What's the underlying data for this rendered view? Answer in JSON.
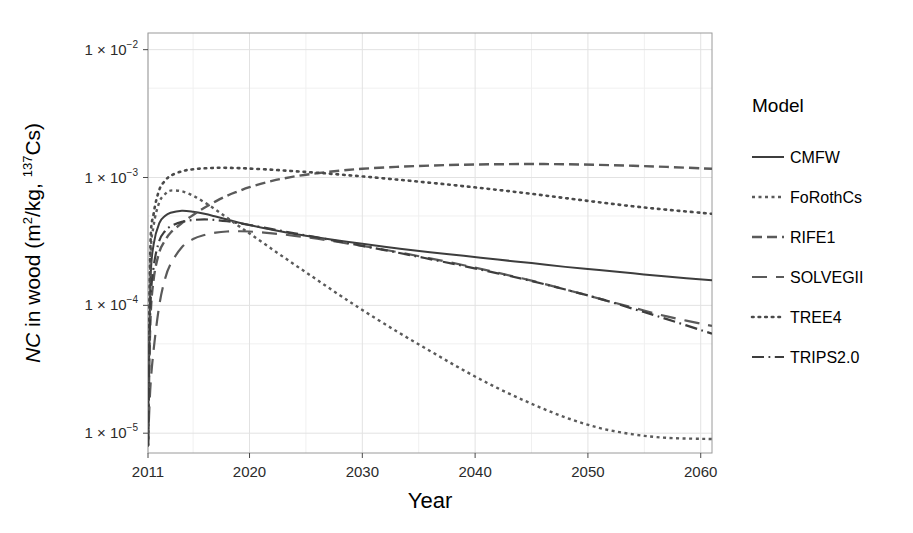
{
  "chart_data": {
    "type": "line",
    "title": "",
    "xlabel": "Year",
    "ylabel_parts": {
      "italic": "NC",
      "rest": " in wood (m",
      "sup1": "2",
      "mid": "/kg, ",
      "sup2": "137",
      "tail": "Cs)"
    },
    "ylabel_plain": "NC in wood (m2/kg, 137Cs)",
    "xlim": [
      2011,
      2061
    ],
    "ylim": [
      7e-06,
      0.0135
    ],
    "yscale": "log",
    "grid": true,
    "legend_position": "right",
    "legend_title": "Model",
    "xticks": [
      2011,
      2020,
      2030,
      2040,
      2050,
      2060
    ],
    "xtick_labels": [
      "2011",
      "2020",
      "2030",
      "2040",
      "2050",
      "2060"
    ],
    "yticks": [
      0.01,
      0.001,
      0.0001,
      1e-05
    ],
    "ytick_labels": [
      "1 × 10",
      "1 × 10",
      "1 × 10",
      "1 × 10"
    ],
    "ytick_exponents": [
      "−2",
      "−3",
      "−4",
      "−5"
    ],
    "x": [
      2011.0,
      2011.2,
      2011.5,
      2012,
      2012.5,
      2013,
      2014,
      2015,
      2016,
      2017,
      2018,
      2019,
      2020,
      2022,
      2024,
      2026,
      2028,
      2030,
      2033,
      2036,
      2039,
      2042,
      2045,
      2048,
      2051,
      2054,
      2057,
      2061
    ],
    "series": [
      {
        "name": "CMFW",
        "style": "solid",
        "color": "#3d3d3d",
        "values": [
          8e-06,
          0.00014,
          0.0003,
          0.00044,
          0.0005,
          0.00053,
          0.00055,
          0.00054,
          0.00052,
          0.000495,
          0.00047,
          0.000445,
          0.000425,
          0.00039,
          0.000362,
          0.00034,
          0.00032,
          0.000303,
          0.00028,
          0.00026,
          0.000244,
          0.000228,
          0.000214,
          0.0002,
          0.000189,
          0.000178,
          0.000168,
          0.000157
        ]
      },
      {
        "name": "FoRothCs",
        "style": "dotted-fine",
        "color": "#5a5a5a",
        "values": [
          8e-06,
          0.0002,
          0.00042,
          0.00064,
          0.00074,
          0.00079,
          0.00078,
          0.00072,
          0.00064,
          0.00056,
          0.000485,
          0.00042,
          0.000365,
          0.000275,
          0.000208,
          0.000158,
          0.00012,
          9.2e-05,
          6.3e-05,
          4.4e-05,
          3.1e-05,
          2.25e-05,
          1.7e-05,
          1.33e-05,
          1.1e-05,
          9.8e-06,
          9.2e-06,
          9e-06
        ]
      },
      {
        "name": "RIFE1",
        "style": "dashed-med",
        "color": "#5a5a5a",
        "values": [
          8e-06,
          7e-05,
          0.00016,
          0.00026,
          0.00032,
          0.00037,
          0.00044,
          0.00051,
          0.00058,
          0.00065,
          0.00072,
          0.00078,
          0.00084,
          0.00094,
          0.00102,
          0.00108,
          0.00113,
          0.00117,
          0.00121,
          0.00124,
          0.00126,
          0.00127,
          0.001275,
          0.00127,
          0.001255,
          0.001235,
          0.00121,
          0.00117
        ]
      },
      {
        "name": "SOLVEGII",
        "style": "dashed-long",
        "color": "#5a5a5a",
        "values": [
          8e-06,
          2.2e-05,
          4.5e-05,
          0.0001,
          0.00016,
          0.00021,
          0.000285,
          0.00033,
          0.000355,
          0.00037,
          0.000378,
          0.00038,
          0.000378,
          0.000366,
          0.00035,
          0.000332,
          0.000312,
          0.000292,
          0.000262,
          0.000233,
          0.000206,
          0.00018,
          0.000156,
          0.000133,
          0.000113,
          9.6e-05,
          8.2e-05,
          6.9e-05
        ]
      },
      {
        "name": "TREE4",
        "style": "dotted",
        "color": "#4a4a4a",
        "values": [
          8e-06,
          0.00026,
          0.00052,
          0.0008,
          0.00094,
          0.00103,
          0.00112,
          0.00116,
          0.00118,
          0.00119,
          0.00119,
          0.001185,
          0.001175,
          0.00115,
          0.00112,
          0.00109,
          0.001055,
          0.00102,
          0.000965,
          0.00091,
          0.000855,
          0.0008,
          0.000745,
          0.00069,
          0.00064,
          0.000595,
          0.00056,
          0.00052
        ]
      },
      {
        "name": "TRIPS2.0",
        "style": "dashdot",
        "color": "#3d3d3d",
        "values": [
          8e-06,
          9e-05,
          0.0002,
          0.00032,
          0.00038,
          0.000415,
          0.00045,
          0.000465,
          0.00047,
          0.000465,
          0.000455,
          0.00044,
          0.000425,
          0.000395,
          0.000366,
          0.00034,
          0.000315,
          0.000292,
          0.00026,
          0.00023,
          0.000203,
          0.000178,
          0.000155,
          0.000133,
          0.000113,
          9.4e-05,
          7.8e-05,
          6e-05
        ]
      }
    ]
  },
  "legend": {
    "title": "Model",
    "items": [
      {
        "label": "CMFW",
        "style": "solid"
      },
      {
        "label": "FoRothCs",
        "style": "dotted-fine"
      },
      {
        "label": "RIFE1",
        "style": "dashed-med"
      },
      {
        "label": "SOLVEGII",
        "style": "dashed-long"
      },
      {
        "label": "TREE4",
        "style": "dotted"
      },
      {
        "label": "TRIPS2.0",
        "style": "dashdot"
      }
    ]
  },
  "axes": {
    "x_title": "Year"
  },
  "colors": {
    "grid": "#e2e2e2",
    "grid_minor": "#f0f0f0",
    "frame": "#9a9a9a",
    "text": "#000000"
  }
}
